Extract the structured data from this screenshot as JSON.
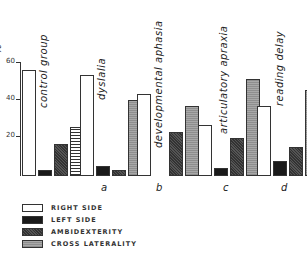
{
  "chart_data": {
    "type": "bar",
    "title": "",
    "xlabel": "",
    "ylabel": "%",
    "ylim": [
      0,
      60
    ],
    "yticks": [
      20,
      40,
      60
    ],
    "categories": [
      "control group",
      "dyslalia",
      "developmental aphasia",
      "articulatory apraxia",
      "reading delay"
    ],
    "category_letters": [
      "",
      "a",
      "b",
      "c",
      "d"
    ],
    "series": [
      {
        "name": "RIGHT SIDE",
        "values": [
          56,
          53,
          43,
          27,
          37
        ]
      },
      {
        "name": "LEFT SIDE",
        "values": [
          3,
          5,
          0,
          4,
          8
        ]
      },
      {
        "name": "AMBIDEXTERITY",
        "values": [
          17,
          3,
          23,
          20,
          15
        ]
      },
      {
        "name": "CROSS LATERALITY",
        "values": [
          26,
          40,
          37,
          51,
          45
        ]
      }
    ],
    "legend_position": "bottom-left",
    "grid": false
  },
  "axis": {
    "unit": "%",
    "ticks": [
      "20",
      "40",
      "60"
    ]
  },
  "groups": [
    {
      "label": "control group",
      "letter": ""
    },
    {
      "label": "dyslalia",
      "letter": "a"
    },
    {
      "label": "developmental aphasia",
      "letter": "b"
    },
    {
      "label": "articulatory apraxia",
      "letter": "c"
    },
    {
      "label": "reading delay",
      "letter": "d"
    }
  ],
  "legend": [
    {
      "label": "RIGHT SIDE"
    },
    {
      "label": "LEFT SIDE"
    },
    {
      "label": "AMBIDEXTERITY"
    },
    {
      "label": "CROSS LATERALITY"
    }
  ]
}
